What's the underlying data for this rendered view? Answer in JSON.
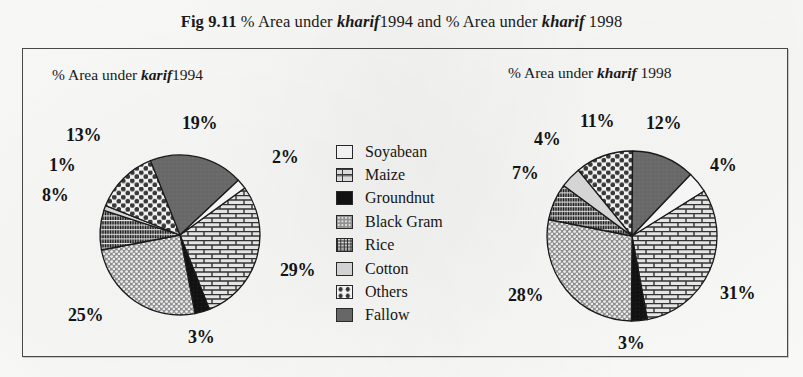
{
  "figure": {
    "label": "Fig 9.11",
    "title_part1": "% Area under ",
    "title_kharif1": "kharif",
    "title_year1": "1994",
    "title_mid": " and % Area under ",
    "title_kharif2": "kharif",
    "title_year2": "1998"
  },
  "panels": {
    "left_title_prefix": "% Area under ",
    "left_title_italic": "karif",
    "left_title_year": "1994",
    "right_title_prefix": "% Area under ",
    "right_title_italic": "kharif",
    "right_title_year": "1998"
  },
  "legend": {
    "items": [
      {
        "label": "Soyabean",
        "pattern": "solid-white",
        "swatch_class": "sw-soyabean",
        "color": "#ffffff"
      },
      {
        "label": "Maize",
        "pattern": "brick",
        "swatch_class": "sw-maize",
        "color": "#e9e9e9"
      },
      {
        "label": "Groundnut",
        "pattern": "solid-black",
        "swatch_class": "sw-groundnut",
        "color": "#121212"
      },
      {
        "label": "Black Gram",
        "pattern": "dots",
        "swatch_class": "sw-blackgram",
        "color": "#9a9a9a"
      },
      {
        "label": "Rice",
        "pattern": "grid-hatch",
        "swatch_class": "sw-rice",
        "color": "#8a8a8a"
      },
      {
        "label": "Cotton",
        "pattern": "solid-light",
        "swatch_class": "sw-cotton",
        "color": "#dcdcdc"
      },
      {
        "label": "Others",
        "pattern": "big-dots",
        "swatch_class": "sw-others",
        "color": "#ffffff"
      },
      {
        "label": "Fallow",
        "pattern": "solid-gray",
        "swatch_class": "sw-fallow",
        "color": "#6b6b6b"
      }
    ]
  },
  "chart_data": [
    {
      "type": "pie",
      "title": "% Area under karif 1994",
      "id": "pie-1994",
      "categories": [
        "Maize",
        "Groundnut",
        "Black Gram",
        "Rice",
        "Cotton",
        "Others",
        "Fallow",
        "Soyabean"
      ],
      "values": [
        29,
        3,
        25,
        8,
        1,
        13,
        19,
        2
      ],
      "labels": [
        "29%",
        "3%",
        "25%",
        "8%",
        "1%",
        "13%",
        "19%",
        "2%"
      ],
      "patterns": [
        "brick",
        "solid-black",
        "dots",
        "grid-hatch",
        "solid-light",
        "big-dots",
        "solid-gray",
        "solid-white"
      ],
      "unit": "%",
      "total": 100,
      "legend_position": "center"
    },
    {
      "type": "pie",
      "title": "% Area under kharif 1998",
      "id": "pie-1998",
      "categories": [
        "Maize",
        "Groundnut",
        "Black Gram",
        "Rice",
        "Cotton",
        "Others",
        "Fallow",
        "Soyabean"
      ],
      "values": [
        31,
        3,
        28,
        7,
        4,
        11,
        12,
        4
      ],
      "labels": [
        "31%",
        "3%",
        "28%",
        "7%",
        "4%",
        "11%",
        "12%",
        "4%"
      ],
      "patterns": [
        "brick",
        "solid-black",
        "dots",
        "grid-hatch",
        "solid-light",
        "big-dots",
        "solid-gray",
        "solid-white"
      ],
      "unit": "%",
      "total": 100,
      "legend_position": "center"
    }
  ],
  "pie_left_labels": [
    {
      "text": "19%",
      "x": 142,
      "y": 8
    },
    {
      "text": "2%",
      "x": 232,
      "y": 42
    },
    {
      "text": "29%",
      "x": 240,
      "y": 155
    },
    {
      "text": "3%",
      "x": 148,
      "y": 222
    },
    {
      "text": "25%",
      "x": 28,
      "y": 200
    },
    {
      "text": "8%",
      "x": 2,
      "y": 80
    },
    {
      "text": "1%",
      "x": 9,
      "y": 50
    },
    {
      "text": "13%",
      "x": 26,
      "y": 20
    }
  ],
  "pie_right_labels": [
    {
      "text": "12%",
      "x": 148,
      "y": 8
    },
    {
      "text": "4%",
      "x": 212,
      "y": 50
    },
    {
      "text": "31%",
      "x": 222,
      "y": 178
    },
    {
      "text": "3%",
      "x": 120,
      "y": 228
    },
    {
      "text": "28%",
      "x": 10,
      "y": 180
    },
    {
      "text": "7%",
      "x": 14,
      "y": 58
    },
    {
      "text": "4%",
      "x": 36,
      "y": 24
    },
    {
      "text": "11%",
      "x": 82,
      "y": 6
    }
  ]
}
